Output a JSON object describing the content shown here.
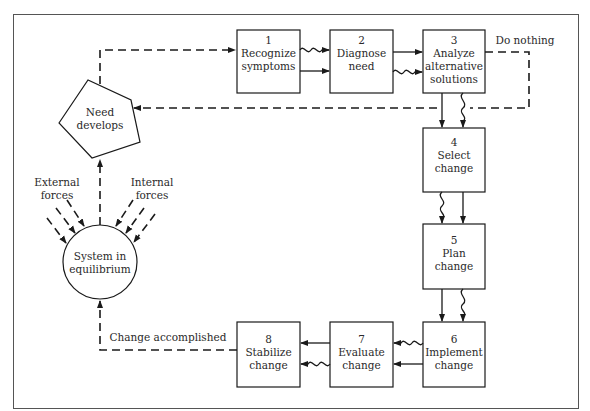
{
  "diagram": {
    "steps": [
      {
        "number": "1",
        "line1": "Recognize",
        "line2": "symptoms"
      },
      {
        "number": "2",
        "line1": "Diagnose",
        "line2": "need"
      },
      {
        "number": "3",
        "line1": "Analyze",
        "line2": "alternative",
        "line3": "solutions"
      },
      {
        "number": "4",
        "line1": "Select",
        "line2": "change"
      },
      {
        "number": "5",
        "line1": "Plan",
        "line2": "change"
      },
      {
        "number": "6",
        "line1": "Implement",
        "line2": "change"
      },
      {
        "number": "7",
        "line1": "Evaluate",
        "line2": "change"
      },
      {
        "number": "8",
        "line1": "Stabilize",
        "line2": "change"
      }
    ],
    "need_node": {
      "line1": "Need",
      "line2": "develops"
    },
    "system_node": {
      "line1": "System in",
      "line2": "equilibrium"
    },
    "external_forces": {
      "line1": "External",
      "line2": "forces"
    },
    "internal_forces": {
      "line1": "Internal",
      "line2": "forces"
    },
    "do_nothing_label": "Do nothing",
    "change_accomplished_label": "Change accomplished",
    "colors": {
      "line": "#1a1a1a",
      "text": "#2a2a2a",
      "frame": "#555555",
      "background": "#ffffff"
    }
  }
}
